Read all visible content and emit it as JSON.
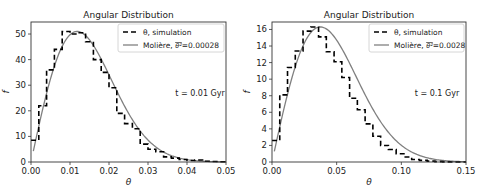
{
  "chart_data": [
    {
      "type": "line",
      "title": "Angular Distribution",
      "xlabel": "θ",
      "ylabel": "f",
      "xlim": [
        0,
        0.05
      ],
      "ylim": [
        0,
        54.7
      ],
      "xticks": [
        0.0,
        0.01,
        0.02,
        0.03,
        0.04,
        0.05
      ],
      "xtick_labels": [
        "0.00",
        "0.01",
        "0.02",
        "0.03",
        "0.04",
        "0.05"
      ],
      "yticks": [
        0,
        10,
        20,
        30,
        40,
        50
      ],
      "ytick_labels": [
        "0",
        "10",
        "20",
        "30",
        "40",
        "50"
      ],
      "grid": false,
      "legend_position": "top-right",
      "annotation": "t = 0.01 Gyr",
      "series": [
        {
          "name": "θ, simulation",
          "style": "dashed-step",
          "color": "#000000",
          "bin_width": 0.002,
          "bin_start": 0.0,
          "values": [
            8.5,
            22,
            36,
            44,
            51,
            50,
            50.5,
            47,
            40,
            35,
            29,
            19,
            15,
            13,
            7,
            5,
            4,
            2,
            1.5,
            1,
            0.6,
            0.8,
            0.3,
            0.2,
            0.1
          ]
        },
        {
          "name": "Molière, θ̅²=0.00028",
          "legend_prefix": "Molière, ",
          "legend_symbol": "θ²",
          "legend_suffix": "=0.00028",
          "style": "solid",
          "color": "#808080",
          "theta_sq_mean": 0.00028
        }
      ]
    },
    {
      "type": "line",
      "title": "Angular Distribution",
      "xlabel": "θ",
      "ylabel": "f",
      "xlim": [
        0,
        0.15
      ],
      "ylim": [
        0,
        16.9
      ],
      "xticks": [
        0.0,
        0.05,
        0.1,
        0.15
      ],
      "xtick_labels": [
        "0.00",
        "0.05",
        "0.10",
        "0.15"
      ],
      "yticks": [
        0,
        2,
        4,
        6,
        8,
        10,
        12,
        14,
        16
      ],
      "ytick_labels": [
        "0",
        "2",
        "4",
        "6",
        "8",
        "10",
        "12",
        "14",
        "16"
      ],
      "grid": false,
      "legend_position": "top-right",
      "annotation": "t = 0.1 Gyr",
      "series": [
        {
          "name": "θ, simulation",
          "style": "dashed-step",
          "color": "#000000",
          "bin_width": 0.006,
          "bin_start": 0.0,
          "values": [
            2.6,
            8.1,
            11.4,
            13.4,
            15.8,
            16.3,
            15.1,
            13.3,
            12.1,
            10.2,
            7.7,
            6.3,
            4.6,
            3.1,
            2.0,
            1.5,
            1.0,
            0.6,
            0.3,
            0.2,
            0.1,
            0.05,
            0.02,
            0,
            0
          ]
        },
        {
          "name": "Molière, θ̅²=0.0028",
          "legend_prefix": "Molière, ",
          "legend_symbol": "θ²",
          "legend_suffix": "=0.0028",
          "style": "solid",
          "color": "#808080",
          "theta_sq_mean": 0.0028
        }
      ]
    }
  ]
}
